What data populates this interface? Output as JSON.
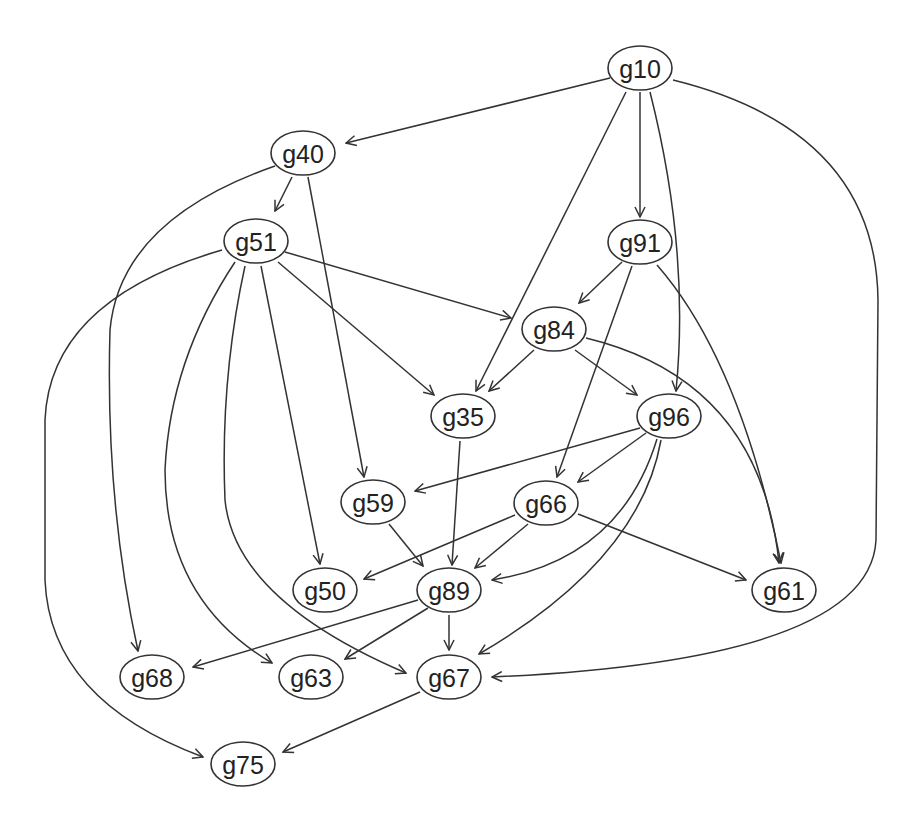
{
  "diagram": {
    "type": "directed-graph",
    "colors": {
      "stroke": "#333333",
      "text": "#222222",
      "background": "#ffffff"
    },
    "nodes": [
      {
        "id": "g10",
        "label": "g10",
        "x": 640,
        "y": 68
      },
      {
        "id": "g40",
        "label": "g40",
        "x": 303,
        "y": 153
      },
      {
        "id": "g51",
        "label": "g51",
        "x": 256,
        "y": 241
      },
      {
        "id": "g91",
        "label": "g91",
        "x": 640,
        "y": 242
      },
      {
        "id": "g84",
        "label": "g84",
        "x": 554,
        "y": 329
      },
      {
        "id": "g35",
        "label": "g35",
        "x": 463,
        "y": 416
      },
      {
        "id": "g96",
        "label": "g96",
        "x": 669,
        "y": 416
      },
      {
        "id": "g59",
        "label": "g59",
        "x": 373,
        "y": 502
      },
      {
        "id": "g66",
        "label": "g66",
        "x": 546,
        "y": 503
      },
      {
        "id": "g50",
        "label": "g50",
        "x": 325,
        "y": 590
      },
      {
        "id": "g89",
        "label": "g89",
        "x": 449,
        "y": 590
      },
      {
        "id": "g61",
        "label": "g61",
        "x": 784,
        "y": 590
      },
      {
        "id": "g68",
        "label": "g68",
        "x": 152,
        "y": 677
      },
      {
        "id": "g63",
        "label": "g63",
        "x": 311,
        "y": 677
      },
      {
        "id": "g67",
        "label": "g67",
        "x": 449,
        "y": 677
      },
      {
        "id": "g75",
        "label": "g75",
        "x": 243,
        "y": 764
      }
    ],
    "edges": [
      {
        "from": "g10",
        "to": "g40",
        "d": "M610,78 L346,143"
      },
      {
        "from": "g10",
        "to": "g35",
        "d": "M626,92 L476,391"
      },
      {
        "from": "g10",
        "to": "g91",
        "d": "M640,92 L640,217"
      },
      {
        "from": "g10",
        "to": "g96",
        "d": "M650,92 Q690,250 676,391"
      },
      {
        "from": "g10",
        "to": "g67",
        "d": "M673,80 Q876,130 878,300 L876,540 Q870,660 492,677"
      },
      {
        "from": "g40",
        "to": "g51",
        "d": "M292,177 L275,211"
      },
      {
        "from": "g40",
        "to": "g59",
        "d": "M308,177 L364,477"
      },
      {
        "from": "g40",
        "to": "g68",
        "d": "M275,166 Q120,220 110,330 Q105,500 138,651"
      },
      {
        "from": "g51",
        "to": "g84",
        "d": "M285,252 L511,318"
      },
      {
        "from": "g51",
        "to": "g35",
        "d": "M278,262 L434,395"
      },
      {
        "from": "g51",
        "to": "g50",
        "d": "M261,266 L320,564"
      },
      {
        "from": "g51",
        "to": "g67",
        "d": "M245,266 Q220,380 225,500 Q235,600 406,673"
      },
      {
        "from": "g51",
        "to": "g63",
        "d": "M235,262 Q170,360 165,470 Q165,600 272,663"
      },
      {
        "from": "g51",
        "to": "g75",
        "d": "M222,250 Q50,300 45,420 L45,580 Q50,700 203,757"
      },
      {
        "from": "g91",
        "to": "g84",
        "d": "M622,262 L579,303"
      },
      {
        "from": "g91",
        "to": "g66",
        "d": "M632,266 L557,477"
      },
      {
        "from": "g91",
        "to": "g61",
        "d": "M657,265 Q740,360 781,563"
      },
      {
        "from": "g84",
        "to": "g35",
        "d": "M534,350 L489,391"
      },
      {
        "from": "g84",
        "to": "g96",
        "d": "M575,350 L637,395"
      },
      {
        "from": "g84",
        "to": "g61",
        "d": "M586,338 Q760,380 779,563"
      },
      {
        "from": "g96",
        "to": "g59",
        "d": "M640,428 L415,491"
      },
      {
        "from": "g96",
        "to": "g66",
        "d": "M646,433 L578,482"
      },
      {
        "from": "g96",
        "to": "g89",
        "d": "M657,439 Q620,560 492,580"
      },
      {
        "from": "g96",
        "to": "g67",
        "d": "M661,440 Q640,560 479,654"
      },
      {
        "from": "g35",
        "to": "g89",
        "d": "M460,441 L452,565"
      },
      {
        "from": "g59",
        "to": "g89",
        "d": "M389,524 L423,566"
      },
      {
        "from": "g66",
        "to": "g50",
        "d": "M515,515 L364,579"
      },
      {
        "from": "g66",
        "to": "g89",
        "d": "M528,524 L475,568"
      },
      {
        "from": "g66",
        "to": "g61",
        "d": "M578,514 L746,580"
      },
      {
        "from": "g89",
        "to": "g68",
        "d": "M418,600 L193,667"
      },
      {
        "from": "g89",
        "to": "g63",
        "d": "M428,608 L345,659"
      },
      {
        "from": "g89",
        "to": "g67",
        "d": "M449,615 L449,650"
      },
      {
        "from": "g67",
        "to": "g75",
        "d": "M420,692 L283,752"
      }
    ]
  }
}
